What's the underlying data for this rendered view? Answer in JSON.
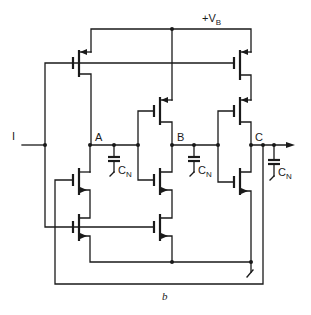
{
  "figure": {
    "caption": "b",
    "supply_label": "+V",
    "supply_subscript": "B",
    "input_label": "I",
    "nodes": [
      {
        "name": "A",
        "label": "A"
      },
      {
        "name": "B",
        "label": "B"
      },
      {
        "name": "C",
        "label": "C"
      }
    ],
    "capacitors": [
      {
        "label": "C",
        "subscript": "N"
      },
      {
        "label": "C",
        "subscript": "N"
      },
      {
        "label": "C",
        "subscript": "N"
      }
    ],
    "colors": {
      "ink": "#1a1a1a",
      "background": "#ffffff"
    }
  }
}
